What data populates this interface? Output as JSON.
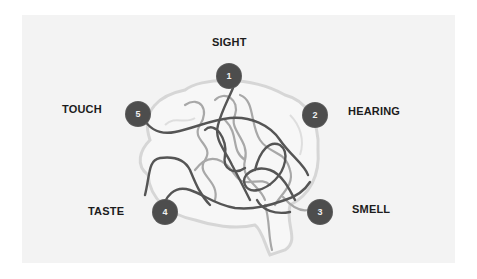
{
  "diagram": {
    "colors": {
      "background": "#ffffff",
      "panel": "#f3f3f3",
      "node_fill": "#4d4d4d",
      "node_text": "#f0f0f0",
      "label_text": "#1c1c1c",
      "dark_line": "#555555",
      "light_line": "#a8a8a8",
      "brain_outline": "#d6d6d6"
    },
    "senses": [
      {
        "number": "1",
        "label": "SIGHT"
      },
      {
        "number": "2",
        "label": "HEARING"
      },
      {
        "number": "3",
        "label": "SMELL"
      },
      {
        "number": "4",
        "label": "TASTE"
      },
      {
        "number": "5",
        "label": "TOUCH"
      }
    ]
  }
}
